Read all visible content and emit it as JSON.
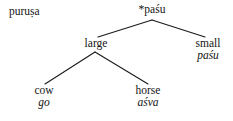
{
  "diagram": {
    "type": "tree",
    "title_text": "puruṣa",
    "background_color": "#ffffff",
    "line_color": "#1a1a1a",
    "text_color": "#141414",
    "standalone_label": {
      "text": "puruṣa",
      "style": "roman"
    },
    "nodes": [
      {
        "id": "root",
        "gloss": "*paśu",
        "form": "",
        "reconstructed": true,
        "level": 0
      },
      {
        "id": "large",
        "gloss": "large",
        "form": "",
        "reconstructed": false,
        "level": 1
      },
      {
        "id": "small",
        "gloss": "small",
        "form": "paśu",
        "reconstructed": false,
        "level": 1
      },
      {
        "id": "cow",
        "gloss": "cow",
        "form": "go",
        "reconstructed": false,
        "level": 2
      },
      {
        "id": "horse",
        "gloss": "horse",
        "form": "aśva",
        "reconstructed": false,
        "level": 2
      }
    ],
    "edges": [
      {
        "from": "root",
        "to": "large"
      },
      {
        "from": "root",
        "to": "small"
      },
      {
        "from": "large",
        "to": "cow"
      },
      {
        "from": "large",
        "to": "horse"
      }
    ]
  }
}
